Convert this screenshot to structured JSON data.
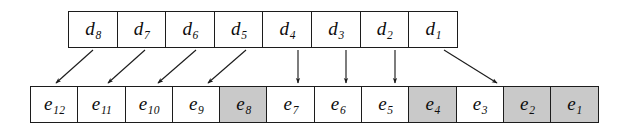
{
  "figure": {
    "name": "data-to-element-mapping-diagram",
    "background_color": "#ffffff",
    "line_color": "#1c1c1c",
    "shaded_color": "#c9c9c9"
  },
  "top_row": {
    "label": "d-array",
    "cells": [
      {
        "base": "d",
        "sub": "8",
        "shaded": false
      },
      {
        "base": "d",
        "sub": "7",
        "shaded": false
      },
      {
        "base": "d",
        "sub": "6",
        "shaded": false
      },
      {
        "base": "d",
        "sub": "5",
        "shaded": false
      },
      {
        "base": "d",
        "sub": "4",
        "shaded": false
      },
      {
        "base": "d",
        "sub": "3",
        "shaded": false
      },
      {
        "base": "d",
        "sub": "2",
        "shaded": false
      },
      {
        "base": "d",
        "sub": "1",
        "shaded": false
      }
    ]
  },
  "bottom_row": {
    "label": "e-array",
    "cells": [
      {
        "base": "e",
        "sub": "12",
        "shaded": false
      },
      {
        "base": "e",
        "sub": "11",
        "shaded": false
      },
      {
        "base": "e",
        "sub": "10",
        "shaded": false
      },
      {
        "base": "e",
        "sub": "9",
        "shaded": false
      },
      {
        "base": "e",
        "sub": "8",
        "shaded": true
      },
      {
        "base": "e",
        "sub": "7",
        "shaded": false
      },
      {
        "base": "e",
        "sub": "6",
        "shaded": false
      },
      {
        "base": "e",
        "sub": "5",
        "shaded": false
      },
      {
        "base": "e",
        "sub": "4",
        "shaded": true
      },
      {
        "base": "e",
        "sub": "3",
        "shaded": false
      },
      {
        "base": "e",
        "sub": "2",
        "shaded": true
      },
      {
        "base": "e",
        "sub": "1",
        "shaded": true
      }
    ]
  },
  "arrows": [
    {
      "from": "d8",
      "to": "e12",
      "kind": "diagonal-left",
      "x1": 93,
      "y1": 50,
      "x2": 56,
      "y2": 83
    },
    {
      "from": "d7",
      "to": "e11",
      "kind": "diagonal-left",
      "x1": 145,
      "y1": 50,
      "x2": 108,
      "y2": 83
    },
    {
      "from": "d6",
      "to": "e10",
      "kind": "diagonal-left",
      "x1": 196,
      "y1": 50,
      "x2": 158,
      "y2": 83
    },
    {
      "from": "d5",
      "to": "e9",
      "kind": "diagonal-left",
      "x1": 246,
      "y1": 50,
      "x2": 208,
      "y2": 83
    },
    {
      "from": "d4",
      "to": "e7",
      "kind": "vertical",
      "x1": 298,
      "y1": 50,
      "x2": 298,
      "y2": 83
    },
    {
      "from": "d3",
      "to": "e6",
      "kind": "vertical",
      "x1": 346,
      "y1": 50,
      "x2": 346,
      "y2": 83
    },
    {
      "from": "d2",
      "to": "e5",
      "kind": "vertical",
      "x1": 395,
      "y1": 50,
      "x2": 395,
      "y2": 83
    },
    {
      "from": "d1",
      "to": "e3",
      "kind": "diagonal-right",
      "x1": 444,
      "y1": 50,
      "x2": 497,
      "y2": 83
    }
  ]
}
